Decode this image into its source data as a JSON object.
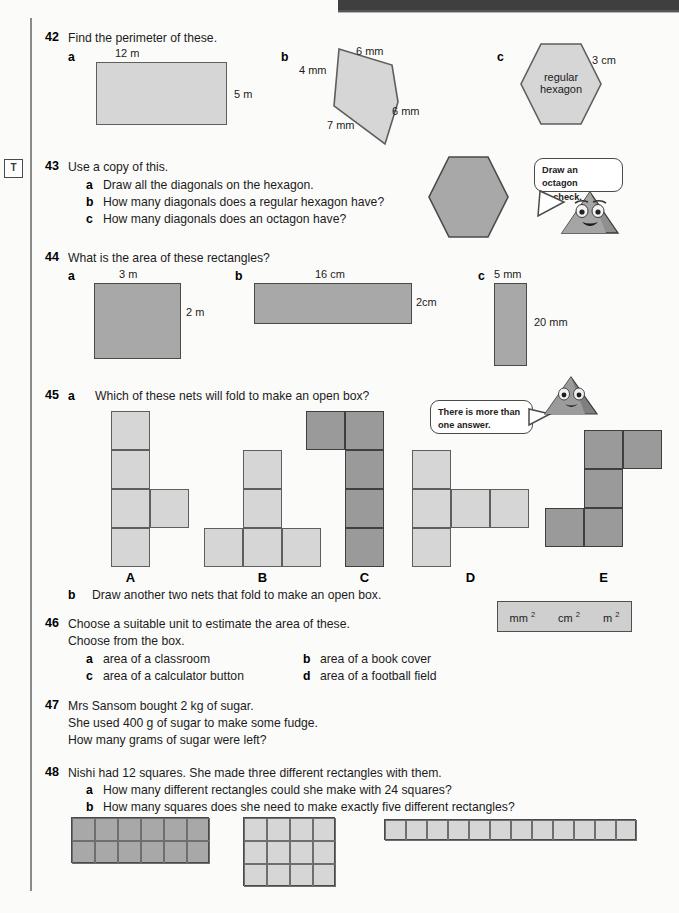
{
  "page": {
    "margin_marker": "T",
    "header_band_color": "#3f3f3f"
  },
  "questions": [
    {
      "number": "42",
      "stem": "Find the perimeter of these.",
      "parts": [
        {
          "letter": "a",
          "shape": "rectangle",
          "labels": {
            "top": "12 m",
            "right": "5 m"
          }
        },
        {
          "letter": "b",
          "shape": "quadrilateral",
          "labels": {
            "top": "6 mm",
            "left": "4 mm",
            "right": "6 mm",
            "bottom": "7 mm"
          }
        },
        {
          "letter": "c",
          "shape": "regular-hexagon",
          "inner_text_line1": "regular",
          "inner_text_line2": "hexagon",
          "labels": {
            "side": "3 cm"
          }
        }
      ]
    },
    {
      "number": "43",
      "stem": "Use a copy of this.",
      "sub": [
        {
          "letter": "a",
          "text": "Draw all the diagonals on the hexagon."
        },
        {
          "letter": "b",
          "text": "How many diagonals does a regular hexagon have?"
        },
        {
          "letter": "c",
          "text": "How many diagonals does an octagon have?"
        }
      ],
      "bubble_line1": "Draw an octagon",
      "bubble_line2": "to check."
    },
    {
      "number": "44",
      "stem": "What is the area of these rectangles?",
      "parts": [
        {
          "letter": "a",
          "labels": {
            "top": "3 m",
            "right": "2 m"
          }
        },
        {
          "letter": "b",
          "labels": {
            "top": "16 cm",
            "right": "2cm"
          }
        },
        {
          "letter": "c",
          "labels": {
            "top": "5 mm",
            "right": "20 mm"
          }
        }
      ]
    },
    {
      "number": "45",
      "part_a_letter": "a",
      "part_a_text": "Which of these nets will fold to make an open box?",
      "bubble_line1": "There is more than",
      "bubble_line2": "one answer.",
      "net_labels": [
        "A",
        "B",
        "C",
        "D",
        "E"
      ],
      "part_b_letter": "b",
      "part_b_text": "Draw another two nets that fold to make an open box."
    },
    {
      "number": "46",
      "stem_line1": "Choose a suitable unit to estimate the area of these.",
      "stem_line2": "Choose from the box.",
      "unit_box": [
        "mm",
        "cm",
        "m"
      ],
      "unit_exponent": "2",
      "sub": [
        {
          "letter": "a",
          "text": "area of a classroom"
        },
        {
          "letter": "b",
          "text": "area of a book cover"
        },
        {
          "letter": "c",
          "text": "area of a calculator button"
        },
        {
          "letter": "d",
          "text": "area of a football field"
        }
      ]
    },
    {
      "number": "47",
      "lines": [
        "Mrs Sansom bought 2 kg of sugar.",
        "She used 400 g of sugar to make some fudge.",
        "How many grams of sugar were left?"
      ]
    },
    {
      "number": "48",
      "stem": "Nishi had 12 squares. She made three different rectangles with them.",
      "sub": [
        {
          "letter": "a",
          "text": "How many different rectangles could she make with 24 squares?"
        },
        {
          "letter": "b",
          "text": "How many squares does she need to make exactly five different rectangles?"
        }
      ],
      "rectangles": [
        {
          "cols": 6,
          "rows": 2,
          "shade": "mid"
        },
        {
          "cols": 4,
          "rows": 3,
          "shade": "light"
        },
        {
          "cols": 12,
          "rows": 1,
          "shade": "light"
        }
      ]
    }
  ],
  "colors": {
    "shape_light": "#d6d6d6",
    "shape_mid": "#a8a8a8",
    "shape_dark": "#9a9a9a",
    "outline": "#4a4a4a",
    "text": "#1b1b1b"
  }
}
